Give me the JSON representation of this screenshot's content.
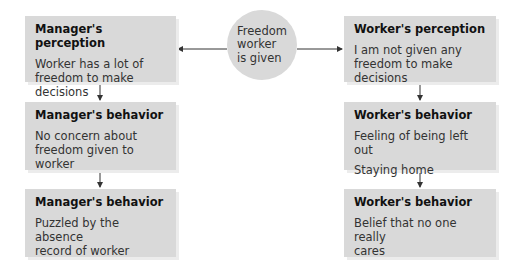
{
  "center": {
    "lines": [
      "Freedom",
      "worker",
      "is given"
    ]
  },
  "manager": [
    {
      "title": "Manager's perception",
      "lines": [
        "Worker has a lot of",
        "freedom to make decisions"
      ]
    },
    {
      "title": "Manager's behavior",
      "lines": [
        "No concern about",
        "freedom given to worker"
      ]
    },
    {
      "title": "Manager's behavior",
      "lines": [
        "Puzzled by the absence",
        "record of worker"
      ]
    }
  ],
  "worker": [
    {
      "title": "Worker's perception",
      "lines": [
        "I am not given any",
        "freedom to make decisions"
      ]
    },
    {
      "title": "Worker's behavior",
      "items": [
        "Feeling of being left out",
        "Staying home"
      ]
    },
    {
      "title": "Worker's behavior",
      "lines": [
        "Belief that no one really",
        "cares"
      ]
    }
  ],
  "colors": {
    "box": "#d9d9d9",
    "arrow": "#333333"
  }
}
